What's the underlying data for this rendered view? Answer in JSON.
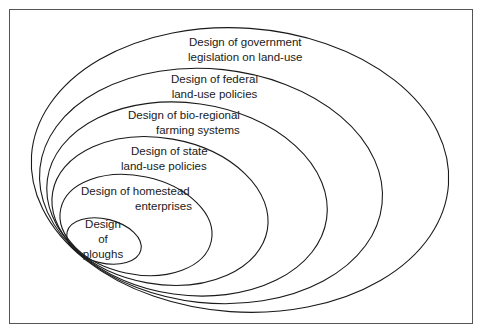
{
  "diagram": {
    "type": "nested-ellipses",
    "levels": [
      {
        "id": "government",
        "line1": "Design of government",
        "line2": "legislation on land-use"
      },
      {
        "id": "federal",
        "line1": "Design of federal",
        "line2": "land-use policies"
      },
      {
        "id": "bioregional",
        "line1": "Design of bio-regional",
        "line2": "farming systems"
      },
      {
        "id": "state",
        "line1": "Design of state",
        "line2": "land-use policies"
      },
      {
        "id": "homestead",
        "line1": "Design of homestead",
        "line2": "enterprises"
      },
      {
        "id": "ploughs",
        "line1": "Design",
        "line2": "of",
        "line3": "ploughs"
      }
    ],
    "colors": {
      "stroke": "#1a1a1a",
      "frame": "#555555",
      "background": "#ffffff"
    }
  }
}
